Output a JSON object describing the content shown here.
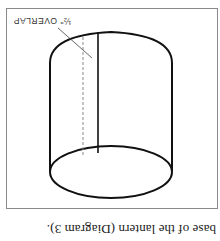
{
  "orientation": "rotated-180",
  "caption": "base of the lantern (Diagram 3).",
  "diagram": {
    "annotation_label": "½\" OVERLAP",
    "colors": {
      "stroke": "#111111",
      "dashed": "#8a8a8a",
      "frame": "#8a8a8a",
      "leader": "#555555",
      "background": "#ffffff"
    }
  }
}
